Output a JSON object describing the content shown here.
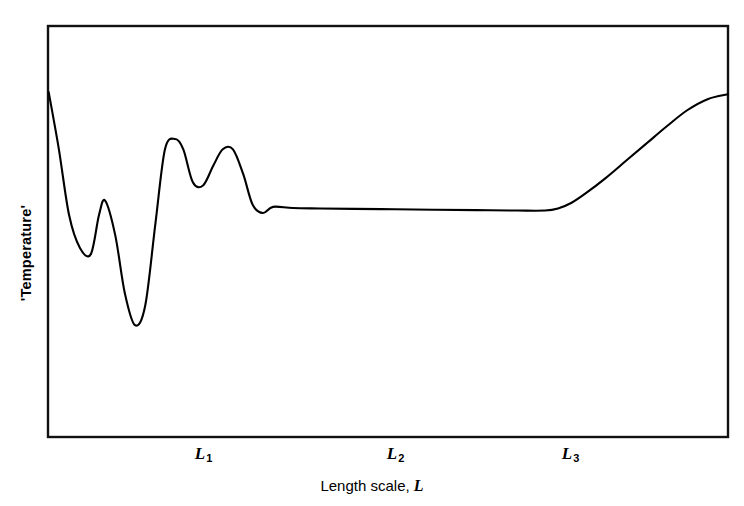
{
  "chart_data": {
    "type": "line",
    "title": "",
    "subtitle": "",
    "xlabel_text": "Length scale,",
    "xlabel_variable": "L",
    "ylabel": "'Temperature'",
    "xlim": [
      0,
      1
    ],
    "ylim": [
      0,
      1
    ],
    "grid": false,
    "legend": "none",
    "axis_tick_values": [],
    "annotations": [],
    "x_ticks": [
      {
        "label_base": "L",
        "label_sub": "1",
        "pixel_x": 203,
        "normalized_x": 0.228
      },
      {
        "label_base": "L",
        "label_sub": "2",
        "pixel_x": 395,
        "normalized_x": 0.51
      },
      {
        "label_base": "L",
        "label_sub": "3",
        "pixel_x": 570,
        "normalized_x": 0.768
      }
    ],
    "series": [
      {
        "name": "temperature-vs-length-scale",
        "description": "Oscillatory fluctuations at small length scales damping into a flat plateau between L1 and L3, then rising sharply beyond L3",
        "x": [
          0.001,
          0.016,
          0.031,
          0.047,
          0.063,
          0.075,
          0.084,
          0.099,
          0.113,
          0.128,
          0.143,
          0.158,
          0.172,
          0.187,
          0.199,
          0.213,
          0.228,
          0.243,
          0.257,
          0.272,
          0.287,
          0.301,
          0.316,
          0.331,
          0.36,
          0.4,
          0.45,
          0.51,
          0.57,
          0.63,
          0.69,
          0.731,
          0.75,
          0.77,
          0.79,
          0.82,
          0.85,
          0.88,
          0.91,
          0.94,
          0.97,
          1.0
        ],
        "y": [
          0.839,
          0.7,
          0.54,
          0.46,
          0.445,
          0.54,
          0.575,
          0.49,
          0.35,
          0.272,
          0.32,
          0.52,
          0.7,
          0.725,
          0.7,
          0.62,
          0.612,
          0.66,
          0.7,
          0.7,
          0.64,
          0.565,
          0.545,
          0.56,
          0.557,
          0.556,
          0.555,
          0.554,
          0.553,
          0.552,
          0.551,
          0.551,
          0.556,
          0.57,
          0.592,
          0.63,
          0.672,
          0.714,
          0.756,
          0.795,
          0.822,
          0.834
        ]
      }
    ],
    "features": {
      "plateau_region": "between L1 and L3",
      "plateau_level_normalized": 0.553,
      "rise_onset_normalized_x": 0.731,
      "curve_start_normalized_y": 0.839,
      "curve_end_normalized_y": 0.834,
      "deep_minimum_normalized": {
        "x": 0.128,
        "y": 0.272
      }
    }
  },
  "frame": {
    "left": 48,
    "right": 728,
    "top": 26,
    "bottom": 437
  }
}
